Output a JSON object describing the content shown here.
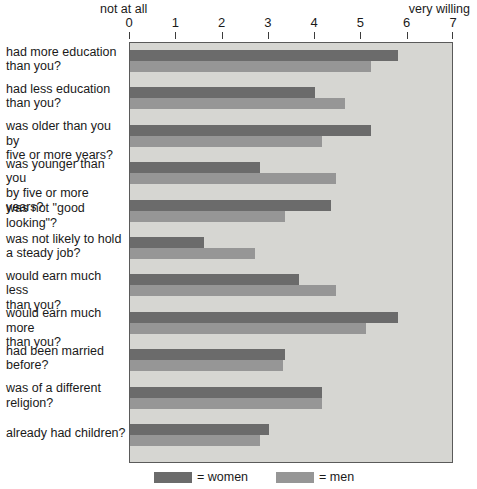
{
  "axis": {
    "left_caption": "not at all",
    "right_caption": "very willing",
    "ticks": [
      "0",
      "1",
      "2",
      "3",
      "4",
      "5",
      "6",
      "7"
    ],
    "min": 0,
    "max": 7
  },
  "legend": {
    "women_label": "= women",
    "men_label": "= men",
    "women_color": "#6b6b6b",
    "men_color": "#969696"
  },
  "plot_style": {
    "background": "#d6d6d2",
    "border": "#5a5a5a"
  },
  "chart_data": {
    "type": "bar",
    "orientation": "horizontal",
    "title": "",
    "xlabel": "",
    "ylabel": "",
    "xlim": [
      0,
      7
    ],
    "grid": false,
    "legend_position": "bottom",
    "axis_end_labels": {
      "low": "not at all",
      "high": "very willing"
    },
    "xticks": [
      0,
      1,
      2,
      3,
      4,
      5,
      6,
      7
    ],
    "categories": [
      "had more education than you?",
      "had less education than you?",
      "was older than you by five or more years?",
      "was younger than you by five or more years?",
      "was not \"good looking\"?",
      "was not likely to hold a steady job?",
      "would earn much less than you?",
      "would earn much more than you?",
      "had been married before?",
      "was of a different religion?",
      "already had children?"
    ],
    "category_lines": [
      [
        "had more education",
        "than you?"
      ],
      [
        "had less education",
        "than you?"
      ],
      [
        "was older than you by",
        "five or more years?"
      ],
      [
        "was younger than you",
        "by five or more years?"
      ],
      [
        "was not \"good looking\"?"
      ],
      [
        "was not likely to hold",
        "a steady job?"
      ],
      [
        "would earn much less",
        "than you?"
      ],
      [
        "would earn much more",
        "than you?"
      ],
      [
        "had been married",
        "before?"
      ],
      [
        "was of a different",
        "religion?"
      ],
      [
        "already had children?"
      ]
    ],
    "series": [
      {
        "name": "women",
        "color": "#6b6b6b",
        "values": [
          5.8,
          4.0,
          5.2,
          2.8,
          4.35,
          1.6,
          3.65,
          5.8,
          3.35,
          4.15,
          3.0
        ]
      },
      {
        "name": "men",
        "color": "#969696",
        "values": [
          5.2,
          4.65,
          4.15,
          4.45,
          3.35,
          2.7,
          4.45,
          5.1,
          3.3,
          4.15,
          2.8
        ]
      }
    ]
  }
}
